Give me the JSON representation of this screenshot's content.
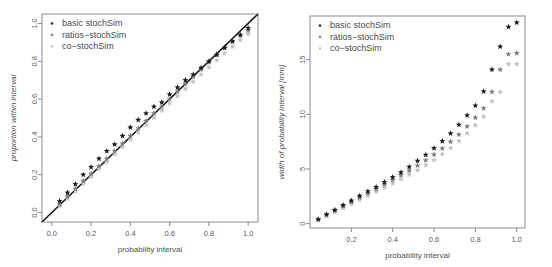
{
  "figure": {
    "panel_count": 2,
    "background": "#ffffff"
  },
  "series_style": {
    "basic": "#1c1c1c",
    "ratios": "#7d7d7d",
    "co": "#c2c2c2"
  },
  "chart_data": [
    {
      "type": "scatter",
      "panel": "left",
      "title": "",
      "xlabel": "probability interval",
      "ylabel": "proportion within interval",
      "xlim": [
        -0.05,
        1.05
      ],
      "ylim": [
        -0.05,
        1.05
      ],
      "xticks": [
        0.0,
        0.2,
        0.4,
        0.6,
        0.8,
        1.0
      ],
      "xtick_labels": [
        "0.0",
        "0.2",
        "0.4",
        "0.6",
        "0.8",
        "1.0"
      ],
      "yticks": [
        0.0,
        0.2,
        0.4,
        0.6,
        0.8,
        1.0
      ],
      "ytick_labels": [
        "0.0",
        "0.2",
        "0.4",
        "0.6",
        "0.8",
        "1.0"
      ],
      "grid": false,
      "legend_position": "top-left",
      "reference_line": {
        "type": "identity",
        "from": [
          -0.05,
          -0.05
        ],
        "to": [
          1.05,
          1.05
        ],
        "color": "#1a1a1a"
      },
      "legend": [
        "basic stochSim",
        "ratios−stochSim",
        "co−stochSim"
      ],
      "x": [
        0.04,
        0.08,
        0.12,
        0.16,
        0.2,
        0.24,
        0.28,
        0.32,
        0.36,
        0.4,
        0.44,
        0.48,
        0.52,
        0.56,
        0.6,
        0.64,
        0.68,
        0.72,
        0.76,
        0.8,
        0.84,
        0.88,
        0.92,
        0.96,
        1.0
      ],
      "series": [
        {
          "name": "basic stochSim",
          "color": "#1c1c1c",
          "values": [
            0.06,
            0.105,
            0.15,
            0.2,
            0.24,
            0.285,
            0.325,
            0.36,
            0.405,
            0.45,
            0.49,
            0.525,
            0.56,
            0.583,
            0.625,
            0.662,
            0.7,
            0.73,
            0.765,
            0.8,
            0.835,
            0.872,
            0.905,
            0.94,
            0.975
          ]
        },
        {
          "name": "ratios−stochSim",
          "color": "#7d7d7d",
          "values": [
            0.043,
            0.085,
            0.125,
            0.168,
            0.205,
            0.245,
            0.285,
            0.325,
            0.365,
            0.405,
            0.445,
            0.485,
            0.525,
            0.56,
            0.6,
            0.64,
            0.68,
            0.718,
            0.757,
            0.795,
            0.833,
            0.87,
            0.905,
            0.935,
            0.963
          ]
        },
        {
          "name": "co−stochSim",
          "color": "#c2c2c2",
          "values": [
            0.035,
            0.073,
            0.113,
            0.152,
            0.19,
            0.23,
            0.268,
            0.308,
            0.347,
            0.385,
            0.425,
            0.463,
            0.502,
            0.54,
            0.578,
            0.617,
            0.655,
            0.693,
            0.73,
            0.768,
            0.805,
            0.842,
            0.878,
            0.912,
            0.945
          ]
        }
      ]
    },
    {
      "type": "scatter",
      "panel": "right",
      "title": "",
      "xlabel": "probability interval",
      "ylabel": "width of probability interval [mm]",
      "xlim": [
        0.0,
        1.04
      ],
      "ylim": [
        -0.4,
        19.0
      ],
      "xticks": [
        0.2,
        0.4,
        0.6,
        0.8,
        1.0
      ],
      "xtick_labels": [
        "0.2",
        "0.4",
        "0.6",
        "0.8",
        "1.0"
      ],
      "yticks": [
        0,
        5,
        10,
        15
      ],
      "ytick_labels": [
        "0",
        "5",
        "10",
        "15"
      ],
      "grid": false,
      "legend_position": "top-left",
      "legend": [
        "basic stochSim",
        "ratios−stochSim",
        "co−stochSim"
      ],
      "x": [
        0.04,
        0.08,
        0.12,
        0.16,
        0.2,
        0.24,
        0.28,
        0.32,
        0.36,
        0.4,
        0.44,
        0.48,
        0.52,
        0.56,
        0.6,
        0.64,
        0.68,
        0.72,
        0.76,
        0.8,
        0.84,
        0.88,
        0.92,
        0.96,
        1.0
      ],
      "series": [
        {
          "name": "basic stochSim",
          "color": "#1c1c1c",
          "values": [
            0.4,
            0.85,
            1.25,
            1.7,
            2.1,
            2.55,
            2.95,
            3.35,
            3.8,
            4.25,
            4.7,
            5.2,
            5.75,
            6.3,
            6.9,
            7.55,
            8.25,
            9.05,
            9.9,
            10.8,
            12.1,
            14.1,
            16.2,
            18.0,
            18.4
          ]
        },
        {
          "name": "ratios−stochSim",
          "color": "#7d7d7d",
          "values": [
            0.38,
            0.8,
            1.18,
            1.58,
            1.98,
            2.38,
            2.78,
            3.18,
            3.58,
            4.0,
            4.42,
            4.85,
            5.32,
            5.8,
            6.32,
            6.88,
            7.5,
            8.15,
            8.9,
            9.7,
            10.55,
            12.05,
            14.1,
            15.5,
            15.6
          ]
        },
        {
          "name": "co−stochSim",
          "color": "#c2c2c2",
          "values": [
            0.3,
            0.68,
            1.05,
            1.42,
            1.8,
            2.18,
            2.55,
            2.92,
            3.3,
            3.68,
            4.08,
            4.48,
            4.9,
            5.35,
            5.82,
            6.35,
            6.92,
            7.55,
            8.25,
            9.0,
            9.8,
            11.2,
            12.05,
            14.6,
            14.6
          ]
        }
      ]
    }
  ]
}
